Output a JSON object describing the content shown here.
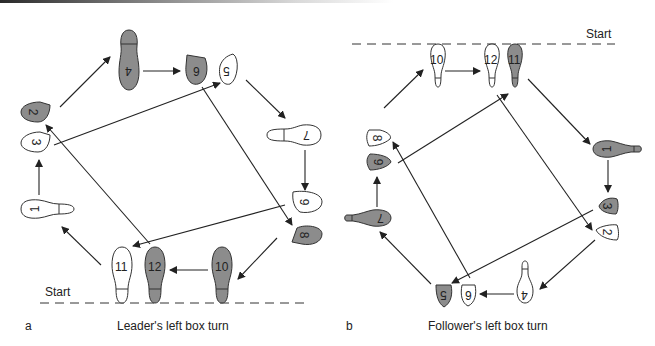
{
  "panels": [
    {
      "letter": "a",
      "caption": "Leader's left box turn",
      "start_label": "Start",
      "steps": [
        {
          "n": "1",
          "foot": "white",
          "shape": "full"
        },
        {
          "n": "2",
          "foot": "gray",
          "shape": "ball"
        },
        {
          "n": "3",
          "foot": "white",
          "shape": "ball"
        },
        {
          "n": "4",
          "foot": "gray",
          "shape": "full"
        },
        {
          "n": "5",
          "foot": "white",
          "shape": "ball"
        },
        {
          "n": "6",
          "foot": "gray",
          "shape": "ball"
        },
        {
          "n": "7",
          "foot": "white",
          "shape": "full"
        },
        {
          "n": "8",
          "foot": "gray",
          "shape": "ball"
        },
        {
          "n": "9",
          "foot": "white",
          "shape": "ball"
        },
        {
          "n": "10",
          "foot": "gray",
          "shape": "full"
        },
        {
          "n": "11",
          "foot": "white",
          "shape": "full"
        },
        {
          "n": "12",
          "foot": "gray",
          "shape": "full"
        }
      ]
    },
    {
      "letter": "b",
      "caption": "Follower's left box turn",
      "start_label": "Start",
      "steps": [
        {
          "n": "1",
          "foot": "gray",
          "shape": "full"
        },
        {
          "n": "2",
          "foot": "white",
          "shape": "ball"
        },
        {
          "n": "3",
          "foot": "gray",
          "shape": "ball"
        },
        {
          "n": "4",
          "foot": "white",
          "shape": "full"
        },
        {
          "n": "5",
          "foot": "gray",
          "shape": "ball"
        },
        {
          "n": "6",
          "foot": "white",
          "shape": "ball"
        },
        {
          "n": "7",
          "foot": "gray",
          "shape": "full"
        },
        {
          "n": "8",
          "foot": "white",
          "shape": "ball"
        },
        {
          "n": "9",
          "foot": "gray",
          "shape": "ball"
        },
        {
          "n": "10",
          "foot": "white",
          "shape": "full"
        },
        {
          "n": "11",
          "foot": "gray",
          "shape": "full"
        },
        {
          "n": "12",
          "foot": "white",
          "shape": "full"
        }
      ]
    }
  ],
  "colors": {
    "gray_foot": "#8c8c8c",
    "white_foot": "#ffffff",
    "stroke": "#333333"
  }
}
